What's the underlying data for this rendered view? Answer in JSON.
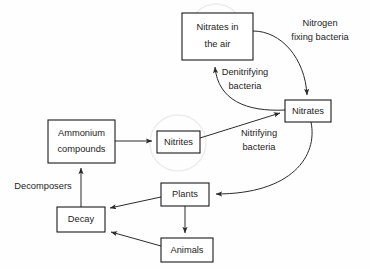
{
  "diagram": {
    "background_color": "#fefefe",
    "line_color": "#2b2b2b",
    "box_fill": "#ffffff",
    "box_stroke": "#1a1a1a",
    "text_color": "#1c1c1c",
    "watermark_color": "#ededed",
    "nodes": [
      {
        "id": "nitrates-in-the-air",
        "label_line1": "Nitrates in",
        "label_line2": "the air",
        "x": 182,
        "y": 13,
        "w": 71,
        "h": 47
      },
      {
        "id": "nitrates",
        "label_line1": "Nitrates",
        "label_line2": "",
        "x": 285,
        "y": 100,
        "w": 46,
        "h": 22
      },
      {
        "id": "ammonium-compounds",
        "label_line1": "Ammonium",
        "label_line2": "compounds",
        "x": 48,
        "y": 120,
        "w": 67,
        "h": 43
      },
      {
        "id": "nitrites",
        "label_line1": "Nitrites",
        "label_line2": "",
        "x": 157,
        "y": 131,
        "w": 43,
        "h": 22
      },
      {
        "id": "plants",
        "label_line1": "Plants",
        "label_line2": "",
        "x": 161,
        "y": 183,
        "w": 48,
        "h": 23
      },
      {
        "id": "decay",
        "label_line1": "Decay",
        "label_line2": "",
        "x": 57,
        "y": 207,
        "w": 48,
        "h": 25
      },
      {
        "id": "animals",
        "label_line1": "Animals",
        "label_line2": "",
        "x": 161,
        "y": 238,
        "w": 52,
        "h": 24
      }
    ],
    "edge_labels": [
      {
        "id": "nitrogen-fixing-bacteria",
        "line1": "Nitrogen",
        "line2": "fixing bacteria",
        "x": 320,
        "y": 30
      },
      {
        "id": "denitrifying-bacteria",
        "line1": "Denitrifying",
        "line2": "bacteria",
        "x": 245,
        "y": 79
      },
      {
        "id": "nitrifying-bacteria",
        "line1": "Nitrifying",
        "line2": "bacteria",
        "x": 259,
        "y": 140
      },
      {
        "id": "decomposers",
        "line1": "Decomposers",
        "line2": "",
        "x": 43,
        "y": 187
      }
    ],
    "edges": [
      {
        "id": "air-to-nitrates",
        "from": "nitrates-in-the-air",
        "to": "nitrates",
        "relation": "nitrogen fixing bacteria"
      },
      {
        "id": "nitrates-to-air",
        "from": "nitrates",
        "to": "nitrates-in-the-air",
        "relation": "denitrifying bacteria"
      },
      {
        "id": "ammonium-to-nitrites",
        "from": "ammonium-compounds",
        "to": "nitrites",
        "relation": "nitrifying bacteria"
      },
      {
        "id": "nitrites-to-nitrates",
        "from": "nitrites",
        "to": "nitrates",
        "relation": "nitrifying bacteria"
      },
      {
        "id": "nitrates-to-plants",
        "from": "nitrates",
        "to": "plants",
        "relation": "uptake"
      },
      {
        "id": "plants-to-animals",
        "from": "plants",
        "to": "animals",
        "relation": "eaten"
      },
      {
        "id": "plants-to-decay",
        "from": "plants",
        "to": "decay",
        "relation": "death"
      },
      {
        "id": "animals-to-decay",
        "from": "animals",
        "to": "decay",
        "relation": "death"
      },
      {
        "id": "decay-to-ammonium",
        "from": "decay",
        "to": "ammonium-compounds",
        "relation": "decomposers"
      }
    ]
  }
}
